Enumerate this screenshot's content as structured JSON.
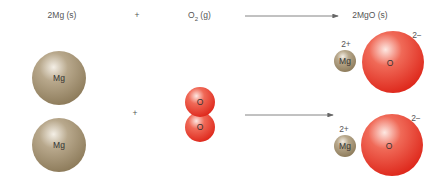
{
  "equation": {
    "reactant1": "2Mg (s)",
    "plus": "+",
    "reactant2_main": "O",
    "reactant2_sub": "2",
    "reactant2_state": " (g)",
    "product": "2MgO (s)"
  },
  "atoms": {
    "mg_label": "Mg",
    "o_label": "O",
    "mg_charge": "2+",
    "o_charge": "2−"
  },
  "colors": {
    "magnesium": "#9b8a6e",
    "oxygen": "#e53020",
    "arrow": "#666666",
    "text": "#555555"
  }
}
